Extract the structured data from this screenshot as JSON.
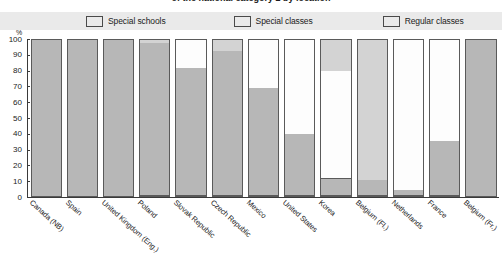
{
  "chart_title": "of the national category 2 by location",
  "axis": {
    "y_unit": "%",
    "y_ticks": [
      "100",
      "90",
      "80",
      "70",
      "60",
      "50",
      "40",
      "30",
      "20",
      "10",
      "0"
    ],
    "y_min": 0,
    "y_max": 100
  },
  "legend": [
    {
      "label": "Special schools",
      "color": "#b7b7b7",
      "icon": "legend-swatch-icon"
    },
    {
      "label": "Special classes",
      "color": "#fdfdfd",
      "icon": "legend-swatch-icon"
    },
    {
      "label": "Regular classes",
      "color": "#d3d3d3",
      "icon": "legend-swatch-icon"
    }
  ],
  "chart_data": {
    "type": "bar",
    "title": "of the national category 2 by location",
    "xlabel": "",
    "ylabel": "%",
    "ylim": [
      0,
      100
    ],
    "grid": false,
    "stacked": true,
    "legend_position": "top",
    "categories": [
      "Canada (NB)",
      "Spain",
      "United Kingdom (Eng.)",
      "Poland",
      "Slovak Republic",
      "Czech Republic",
      "Mexico",
      "United States",
      "Korea",
      "Belgium (Fl.)",
      "Netherlands",
      "France",
      "Belgium (Fr.)"
    ],
    "series": [
      {
        "name": "Special schools",
        "color": "#b7b7b7",
        "values": [
          100,
          100,
          100,
          98,
          82,
          93,
          69,
          40,
          11,
          10,
          4,
          35,
          100
        ]
      },
      {
        "name": "Special classes",
        "color": "#fdfdfd",
        "values": [
          0,
          0,
          0,
          0,
          18,
          0,
          31,
          60,
          69,
          0,
          96,
          65,
          0
        ]
      },
      {
        "name": "Regular classes",
        "color": "#d3d3d3",
        "values": [
          0,
          0,
          0,
          2,
          0,
          7,
          0,
          0,
          20,
          90,
          0,
          0,
          0
        ]
      }
    ]
  }
}
